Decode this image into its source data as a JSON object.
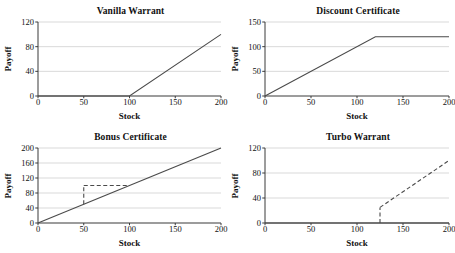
{
  "figure": {
    "background": "#ffffff",
    "line_color": "#4a4a4a",
    "axis_color": "#3a3a3a",
    "grid_color": "#c8c8c8"
  },
  "chart_data": [
    {
      "type": "line",
      "title": "Vanilla Warrant",
      "xlabel": "Stock",
      "ylabel": "Payoff",
      "xlim": [
        0,
        200
      ],
      "ylim": [
        0,
        120
      ],
      "xticks": [
        0,
        50,
        100,
        150,
        200
      ],
      "yticks": [
        0,
        40,
        80,
        120
      ],
      "grid": "horizontal",
      "series": [
        {
          "name": "payoff",
          "style": "solid",
          "x": [
            0,
            100,
            200
          ],
          "values": [
            0,
            0,
            100
          ]
        }
      ]
    },
    {
      "type": "line",
      "title": "Discount Certificate",
      "xlabel": "Stock",
      "ylabel": "Payoff",
      "xlim": [
        0,
        200
      ],
      "ylim": [
        0,
        150
      ],
      "xticks": [
        0,
        50,
        100,
        150,
        200
      ],
      "yticks": [
        0,
        50,
        100,
        150
      ],
      "grid": "horizontal",
      "series": [
        {
          "name": "payoff",
          "style": "solid",
          "x": [
            0,
            120,
            200
          ],
          "values": [
            0,
            120,
            120
          ]
        }
      ]
    },
    {
      "type": "line",
      "title": "Bonus Certificate",
      "xlabel": "Stock",
      "ylabel": "Payoff",
      "xlim": [
        0,
        200
      ],
      "ylim": [
        0,
        200
      ],
      "xticks": [
        0,
        50,
        100,
        150,
        200
      ],
      "yticks": [
        0,
        40,
        80,
        120,
        160,
        200
      ],
      "grid": "horizontal",
      "series": [
        {
          "name": "stock",
          "style": "solid",
          "x": [
            0,
            200
          ],
          "values": [
            0,
            200
          ]
        },
        {
          "name": "bonus-floor",
          "style": "dashed",
          "x": [
            50,
            100
          ],
          "values": [
            100,
            100
          ]
        },
        {
          "name": "barrier-drop",
          "style": "dashed",
          "x": [
            50,
            50
          ],
          "values": [
            50,
            100
          ]
        }
      ]
    },
    {
      "type": "line",
      "title": "Turbo Warrant",
      "xlabel": "Stock",
      "ylabel": "Payoff",
      "xlim": [
        0,
        200
      ],
      "ylim": [
        0,
        120
      ],
      "xticks": [
        0,
        50,
        100,
        150,
        200
      ],
      "yticks": [
        0,
        40,
        80,
        120
      ],
      "grid": "horizontal",
      "series": [
        {
          "name": "knocked-out",
          "style": "solid",
          "x": [
            0,
            200
          ],
          "values": [
            0,
            0
          ]
        },
        {
          "name": "turbo-payoff",
          "style": "dashed",
          "x": [
            125,
            200
          ],
          "values": [
            25,
            100
          ]
        },
        {
          "name": "knock-out-jump",
          "style": "dashed",
          "x": [
            125,
            125
          ],
          "values": [
            0,
            25
          ]
        }
      ]
    }
  ]
}
